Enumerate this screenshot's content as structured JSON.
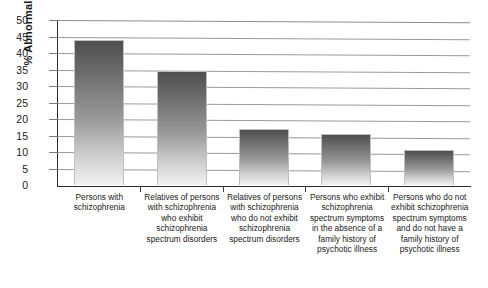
{
  "chart_data": {
    "type": "bar",
    "title": "",
    "xlabel": "",
    "ylabel": "% Abnormal",
    "ylim": [
      0,
      50
    ],
    "yticks": [
      0,
      5,
      10,
      15,
      20,
      25,
      30,
      35,
      40,
      45,
      50
    ],
    "ytick_labels": [
      "0",
      "5",
      "10",
      "15",
      "20",
      "25",
      "30",
      "35",
      "40",
      "45",
      "50"
    ],
    "grid": true,
    "legend": "none",
    "categories": [
      "Persons with schizophrenia",
      "Relatives of persons with schizophrenia who exhibit schizophrenia spectrum disorders",
      "Relatives of persons with schizophrenia who do not exhibit schizophrenia spectrum disorders",
      "Persons who exhibit schizophrenia spectrum symptoms in the absence of a family history of psychotic illness",
      "Persons who do not exhibit schizophrenia spectrum symptoms and do not have a family history of psychotic illness"
    ],
    "values": [
      44,
      34.5,
      17,
      15.5,
      10.5
    ],
    "bar_color_top": "#4f4f4f",
    "bar_color_bottom": "#f2f2f2",
    "axis_color": "#2b2b2b",
    "grid_color": "#9a9a9a",
    "background": "#ffffff"
  }
}
